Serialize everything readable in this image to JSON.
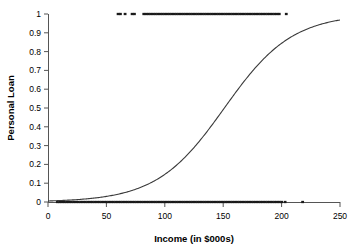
{
  "chart_data": {
    "type": "scatter",
    "title": "",
    "xlabel": "Income (in $000s)",
    "ylabel": "Personal Loan",
    "xlim": [
      0,
      250
    ],
    "ylim": [
      0,
      1
    ],
    "xticks": [
      0,
      50,
      100,
      150,
      200,
      250
    ],
    "xtick_labels": [
      "0",
      "50",
      "100",
      "150",
      "200",
      "250"
    ],
    "yticks": [
      0,
      0.1,
      0.2,
      0.3,
      0.4,
      0.5,
      0.6,
      0.7,
      0.8,
      0.9,
      1
    ],
    "ytick_labels": [
      "0",
      "0.1",
      "0.2",
      "0.3",
      "0.4",
      "0.5",
      "0.6",
      "0.7",
      "0.8",
      "0.9",
      "1"
    ],
    "grid": false,
    "legend": false,
    "line_color": "#3a3a3a",
    "point_color": "#1a1a1a",
    "axis_color": "#555555",
    "series": [
      {
        "name": "Logistic fit",
        "type": "line",
        "model": "logistic",
        "midpoint_x": 151,
        "slope_k": 0.0345,
        "x": [
          0,
          10,
          20,
          30,
          40,
          50,
          60,
          70,
          80,
          90,
          100,
          110,
          120,
          130,
          140,
          150,
          160,
          170,
          180,
          190,
          200,
          210,
          220,
          230,
          240,
          250
        ],
        "y": [
          0.005,
          0.007,
          0.01,
          0.014,
          0.02,
          0.029,
          0.04,
          0.056,
          0.078,
          0.107,
          0.145,
          0.194,
          0.254,
          0.324,
          0.401,
          0.481,
          0.561,
          0.637,
          0.705,
          0.764,
          0.814,
          0.855,
          0.888,
          0.914,
          0.935,
          0.951
        ]
      },
      {
        "name": "Accepted loan (y = 1)",
        "type": "scatter",
        "y_value": 1,
        "x": [
          60,
          62,
          66,
          72,
          74,
          82,
          84,
          86,
          88,
          90,
          92,
          94,
          96,
          98,
          100,
          102,
          104,
          106,
          108,
          110,
          112,
          114,
          116,
          118,
          120,
          122,
          124,
          126,
          128,
          130,
          132,
          134,
          136,
          138,
          140,
          142,
          144,
          146,
          148,
          150,
          152,
          154,
          156,
          158,
          160,
          162,
          164,
          166,
          168,
          170,
          172,
          174,
          176,
          178,
          180,
          182,
          184,
          186,
          188,
          190,
          192,
          194,
          196,
          198,
          204
        ]
      },
      {
        "name": "Declined loan (y = 0)",
        "type": "scatter",
        "y_value": 0,
        "x": [
          8,
          10,
          12,
          14,
          16,
          18,
          20,
          22,
          24,
          26,
          28,
          30,
          32,
          34,
          36,
          38,
          40,
          42,
          44,
          46,
          48,
          50,
          52,
          54,
          56,
          58,
          60,
          62,
          64,
          66,
          68,
          70,
          72,
          74,
          76,
          78,
          80,
          82,
          84,
          86,
          88,
          90,
          92,
          94,
          96,
          98,
          100,
          102,
          104,
          106,
          108,
          110,
          112,
          114,
          116,
          118,
          120,
          122,
          124,
          126,
          128,
          130,
          132,
          134,
          136,
          138,
          140,
          142,
          144,
          146,
          148,
          150,
          152,
          154,
          156,
          158,
          160,
          162,
          164,
          166,
          168,
          170,
          172,
          174,
          176,
          178,
          180,
          182,
          184,
          186,
          188,
          190,
          192,
          194,
          196,
          198,
          200,
          203,
          218
        ]
      }
    ]
  },
  "axes": {
    "y_title": "Personal Loan",
    "x_title": "Income (in $000s)"
  }
}
